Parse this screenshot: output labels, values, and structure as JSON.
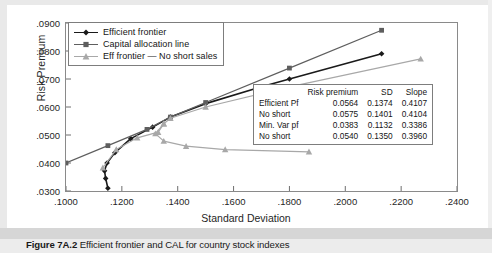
{
  "caption": {
    "label": "Figure 7A.2",
    "text": "Efficient frontier and CAL for country stock indexes"
  },
  "chart_data": {
    "type": "line",
    "title": "",
    "xlabel": "Standard Deviation",
    "ylabel": "Risk Premium",
    "xlim": [
      0.1,
      0.24
    ],
    "ylim": [
      0.03,
      0.09
    ],
    "xticks": [
      ".1000",
      ".1200",
      ".1400",
      ".1600",
      ".1800",
      ".2000",
      ".2200",
      ".2400"
    ],
    "xtick_values": [
      0.1,
      0.12,
      0.14,
      0.16,
      0.18,
      0.2,
      0.22,
      0.24
    ],
    "yticks": [
      ".0300",
      ".0400",
      ".0500",
      ".0600",
      ".0700",
      ".0800",
      ".0900"
    ],
    "ytick_values": [
      0.03,
      0.04,
      0.05,
      0.06,
      0.07,
      0.08,
      0.09
    ],
    "grid": false,
    "legend_position": "top-left",
    "series": [
      {
        "name": "Efficient frontier",
        "color": "#1a1a1a",
        "marker": "diamond",
        "points": [
          [
            0.115,
            0.031
          ],
          [
            0.1142,
            0.0345
          ],
          [
            0.1138,
            0.0372
          ],
          [
            0.1147,
            0.04
          ],
          [
            0.1175,
            0.0437
          ],
          [
            0.1232,
            0.0487
          ],
          [
            0.131,
            0.0528
          ],
          [
            0.1374,
            0.0564
          ],
          [
            0.15,
            0.0612
          ],
          [
            0.17,
            0.0672
          ],
          [
            0.18,
            0.07
          ],
          [
            0.213,
            0.079
          ]
        ]
      },
      {
        "name": "Capital allocation line",
        "color": "#5e5e5e",
        "marker": "square",
        "points": [
          [
            0.1,
            0.04
          ],
          [
            0.115,
            0.0462
          ],
          [
            0.129,
            0.052
          ],
          [
            0.1374,
            0.0564
          ],
          [
            0.15,
            0.0616
          ],
          [
            0.18,
            0.0739
          ],
          [
            0.213,
            0.0874
          ]
        ]
      },
      {
        "name": "Eff frontier — No short sales",
        "color": "#a8a8a8",
        "marker": "triangle",
        "points": [
          [
            0.1132,
            0.0383
          ],
          [
            0.118,
            0.0448
          ],
          [
            0.1255,
            0.049
          ],
          [
            0.133,
            0.051
          ],
          [
            0.135,
            0.054
          ],
          [
            0.1374,
            0.056
          ],
          [
            0.15,
            0.06
          ],
          [
            0.18,
            0.0672
          ],
          [
            0.227,
            0.0772
          ]
        ]
      },
      {
        "name": "No short sales lower branch",
        "color": "#a8a8a8",
        "marker": "triangle",
        "points": [
          [
            0.135,
            0.054
          ],
          [
            0.132,
            0.0505
          ],
          [
            0.135,
            0.0478
          ],
          [
            0.143,
            0.046
          ],
          [
            0.157,
            0.0448
          ],
          [
            0.187,
            0.044
          ]
        ]
      }
    ]
  },
  "legend": {
    "items": [
      {
        "label": "Efficient frontier",
        "color": "#1a1a1a",
        "marker": "diamond"
      },
      {
        "label": "Capital allocation line",
        "color": "#5e5e5e",
        "marker": "square"
      },
      {
        "label": "Eff frontier — No short sales",
        "color": "#a8a8a8",
        "marker": "triangle"
      }
    ]
  },
  "stats_table": {
    "headers": [
      "",
      "Risk premium",
      "SD",
      "Slope"
    ],
    "rows": [
      {
        "name": "Efficient Pf",
        "risk_premium": "0.0564",
        "sd": "0.1374",
        "slope": "0.4107"
      },
      {
        "name": "No short",
        "risk_premium": "0.0575",
        "sd": "0.1401",
        "slope": "0.4104"
      },
      {
        "name": "Min. Var pf",
        "risk_premium": "0.0383",
        "sd": "0.1132",
        "slope": "0.3386"
      },
      {
        "name": "No short",
        "risk_premium": "0.0540",
        "sd": "0.1350",
        "slope": "0.3960"
      }
    ]
  }
}
